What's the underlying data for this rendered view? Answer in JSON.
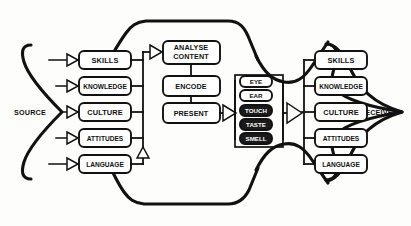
{
  "diagram": {
    "type": "flow-diagram",
    "source": {
      "label": "SOURCE",
      "attributes": [
        {
          "label": "SKILLS"
        },
        {
          "label": "KNOWLEDGE"
        },
        {
          "label": "CULTURE"
        },
        {
          "label": "ATTITUDES"
        },
        {
          "label": "LANGUAGE"
        }
      ]
    },
    "process": {
      "steps": [
        {
          "label": "ANALYSE CONTENT",
          "line1": "ANALYSE",
          "line2": "CONTENT"
        },
        {
          "label": "ENCODE",
          "line1": "ENCODE",
          "line2": ""
        },
        {
          "label": "PRESENT",
          "line1": "PRESENT",
          "line2": ""
        }
      ]
    },
    "channel": {
      "label": "SENSES",
      "senses": [
        {
          "label": "EYE",
          "filled": false
        },
        {
          "label": "EAR",
          "filled": false
        },
        {
          "label": "TOUCH",
          "filled": true
        },
        {
          "label": "TASTE",
          "filled": true
        },
        {
          "label": "SMELL",
          "filled": true
        }
      ]
    },
    "receiver": {
      "label": "RECEIVER",
      "attributes": [
        {
          "label": "SKILLS"
        },
        {
          "label": "KNOWLEDGE"
        },
        {
          "label": "CULTURE"
        },
        {
          "label": "ATTITUDES"
        },
        {
          "label": "LANGUAGE"
        }
      ]
    },
    "colors": {
      "ink": "#111111",
      "paper": "#fdfdfc",
      "fill_dark": "#1a1a1a"
    }
  }
}
